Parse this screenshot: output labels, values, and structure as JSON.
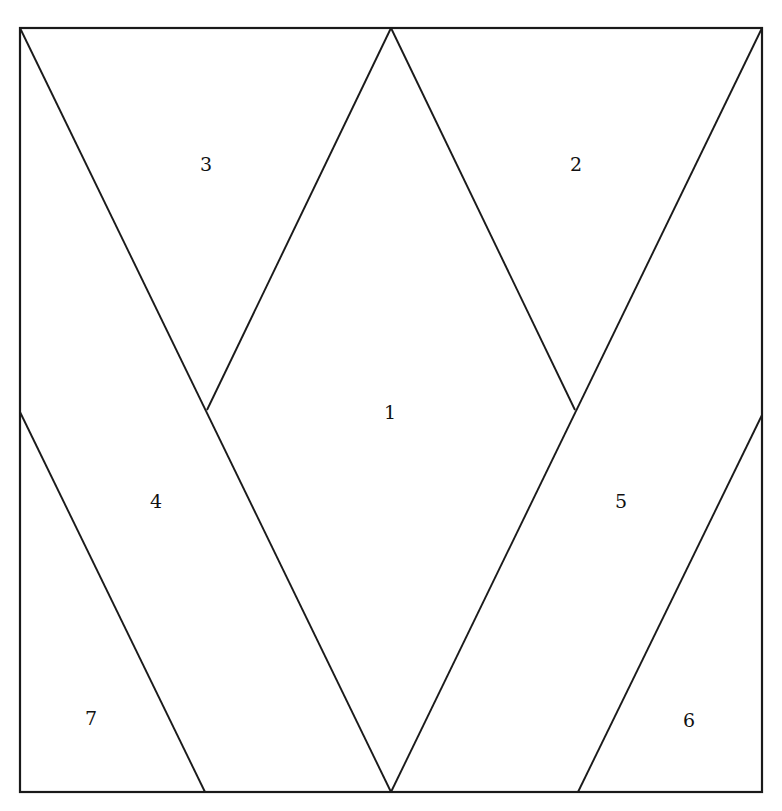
{
  "figure": {
    "type": "geometric-partition-diagram",
    "background_color": "#ffffff",
    "stroke_color": "#1a1a1a",
    "label_color": "#111111",
    "canvas": {
      "width": 782,
      "height": 811
    },
    "frame": {
      "name": "outer-square",
      "x": 20,
      "y": 28,
      "width": 742,
      "height": 764,
      "stroke_width": 2.2
    },
    "vertices": {
      "top_left": [
        20,
        28
      ],
      "top_right": [
        762,
        28
      ],
      "bottom_left": [
        20,
        792
      ],
      "bottom_right": [
        762,
        792
      ],
      "top_apex": [
        391,
        28
      ],
      "bottom_apex": [
        391,
        792
      ],
      "diamond_left": [
        207,
        410
      ],
      "diamond_right": [
        575,
        410
      ],
      "left_edge_split": [
        20,
        412
      ],
      "right_edge_split": [
        762,
        415
      ],
      "bottom_left_split": [
        205,
        792
      ],
      "bottom_right_split": [
        578,
        792
      ]
    },
    "lines": [
      {
        "name": "line-topleft-to-bottom-apex",
        "x1": 20,
        "y1": 28,
        "x2": 391,
        "y2": 792,
        "separates": [
          "3",
          "4",
          "7",
          "1"
        ]
      },
      {
        "name": "line-top-apex-to-diamond-left",
        "x1": 391,
        "y1": 28,
        "x2": 207,
        "y2": 410,
        "separates": [
          "3",
          "1"
        ]
      },
      {
        "name": "line-top-apex-to-diamond-right",
        "x1": 391,
        "y1": 28,
        "x2": 575,
        "y2": 410,
        "separates": [
          "2",
          "1"
        ]
      },
      {
        "name": "line-topright-to-bottom-apex",
        "x1": 762,
        "y1": 28,
        "x2": 391,
        "y2": 792,
        "separates": [
          "2",
          "5",
          "6",
          "1"
        ]
      },
      {
        "name": "line-left-edge-to-bottom-edge",
        "x1": 20,
        "y1": 412,
        "x2": 205,
        "y2": 792,
        "separates": [
          "7",
          "4"
        ]
      },
      {
        "name": "line-right-edge-to-bottom-edge",
        "x1": 762,
        "y1": 415,
        "x2": 578,
        "y2": 792,
        "separates": [
          "6",
          "5"
        ]
      }
    ],
    "labels": [
      {
        "name": "region-label-3",
        "text": "3",
        "x": 206,
        "y": 166
      },
      {
        "name": "region-label-2",
        "text": "2",
        "x": 576,
        "y": 166
      },
      {
        "name": "region-label-1",
        "text": "1",
        "x": 390,
        "y": 414
      },
      {
        "name": "region-label-4",
        "text": "4",
        "x": 156,
        "y": 503
      },
      {
        "name": "region-label-5",
        "text": "5",
        "x": 621,
        "y": 503
      },
      {
        "name": "region-label-7",
        "text": "7",
        "x": 91,
        "y": 720
      },
      {
        "name": "region-label-6",
        "text": "6",
        "x": 689,
        "y": 722
      }
    ]
  }
}
